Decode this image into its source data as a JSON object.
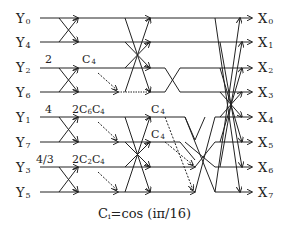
{
  "diagram": {
    "type": "idct-butterfly-flow-graph",
    "inputs": [
      {
        "base": "Y",
        "sub": "0"
      },
      {
        "base": "Y",
        "sub": "4"
      },
      {
        "base": "Y",
        "sub": "2"
      },
      {
        "base": "Y",
        "sub": "6"
      },
      {
        "base": "Y",
        "sub": "1"
      },
      {
        "base": "Y",
        "sub": "7"
      },
      {
        "base": "Y",
        "sub": "3"
      },
      {
        "base": "Y",
        "sub": "5"
      }
    ],
    "outputs": [
      {
        "base": "X",
        "sub": "0"
      },
      {
        "base": "X",
        "sub": "1"
      },
      {
        "base": "X",
        "sub": "2"
      },
      {
        "base": "X",
        "sub": "3"
      },
      {
        "base": "X",
        "sub": "4"
      },
      {
        "base": "X",
        "sub": "5"
      },
      {
        "base": "X",
        "sub": "6"
      },
      {
        "base": "X",
        "sub": "7"
      }
    ],
    "coefficients": {
      "y2_scale": "2",
      "y2_mult": {
        "base": "C",
        "sub": "4"
      },
      "y1_scale": "4",
      "y1_mult": {
        "p1": "2C",
        "s1": "6",
        "p2": "C",
        "s2": "4"
      },
      "y3_scale": "4/3",
      "y3_mult": {
        "p1": "2C",
        "s1": "2",
        "p2": "C",
        "s2": "4"
      },
      "stage3_mult_a": {
        "base": "C",
        "sub": "4"
      },
      "stage3_mult_b": {
        "base": "C",
        "sub": "4"
      }
    },
    "caption": {
      "lhs_base": "C",
      "lhs_sub": "i",
      "rhs": "=cos (iπ/16)"
    }
  }
}
